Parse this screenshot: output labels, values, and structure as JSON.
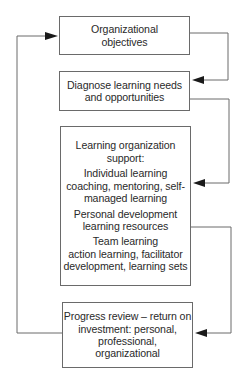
{
  "diagram": {
    "nodes": [
      {
        "id": "objectives",
        "lines": [
          "Organizational",
          "objectives"
        ]
      },
      {
        "id": "diagnose",
        "lines": [
          "Diagnose learning needs",
          "and opportunities"
        ]
      },
      {
        "id": "support",
        "paragraphs": [
          {
            "lines": [
              "Learning organization",
              "support:"
            ]
          },
          {
            "lines": [
              "Individual learning",
              "coaching, mentoring, self-",
              "managed learning"
            ]
          },
          {
            "lines": [
              "Personal development",
              "learning resources"
            ]
          },
          {
            "lines": [
              "Team learning",
              "action learning, facilitator",
              "development, learning sets"
            ]
          }
        ]
      },
      {
        "id": "review",
        "lines": [
          "Progress review – return on",
          "investment: personal,",
          "professional,",
          "organizational"
        ]
      }
    ],
    "edges": [
      {
        "from": "objectives",
        "to": "diagnose",
        "side": "right"
      },
      {
        "from": "diagnose",
        "to": "support",
        "side": "right"
      },
      {
        "from": "support",
        "to": "review",
        "side": "right"
      },
      {
        "from": "review",
        "to": "objectives",
        "side": "left",
        "label": "feedback loop"
      }
    ],
    "colors": {
      "line": "#6a6a6a",
      "arrow": "#1a1a1a",
      "text": "#2a2a2a"
    }
  }
}
